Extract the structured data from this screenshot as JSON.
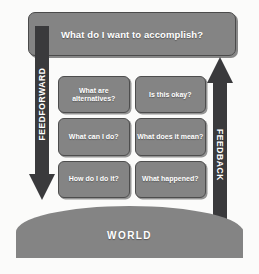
{
  "diagram": {
    "goal": {
      "label": "What do I want to accomplish?"
    },
    "arrows": [
      {
        "name": "feedforward",
        "label": "FEEDFORWARD",
        "direction": "down",
        "side": "left"
      },
      {
        "name": "feedback",
        "label": "FEEDBACK",
        "direction": "up",
        "side": "right"
      }
    ],
    "questions": [
      {
        "label": "What are alternatives?",
        "column": "left",
        "row": 1
      },
      {
        "label": "Is this okay?",
        "column": "right",
        "row": 1
      },
      {
        "label": "What can I do?",
        "column": "left",
        "row": 2
      },
      {
        "label": "What does it mean?",
        "column": "right",
        "row": 2
      },
      {
        "label": "How do I do it?",
        "column": "left",
        "row": 3
      },
      {
        "label": "What happened?",
        "column": "right",
        "row": 3
      }
    ],
    "world": {
      "label": "WORLD"
    },
    "colors": {
      "box_fill": "#848484",
      "box_border": "#4a4a4a",
      "arrow_fill": "#3a3a3c",
      "text": "#ffffff",
      "background": "#fbfbfa"
    }
  }
}
